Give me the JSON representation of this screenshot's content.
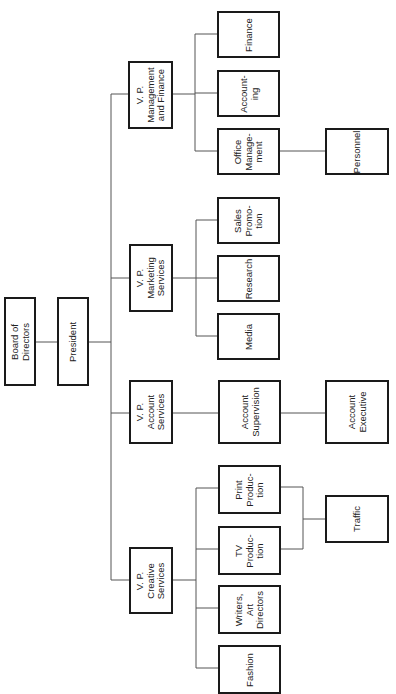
{
  "org_chart": {
    "orientation": "rotated-90-ccw",
    "nodes": {
      "board": {
        "label": "Board of\nDirectors"
      },
      "president": {
        "label": "President"
      },
      "vp_mgmt": {
        "label": "V. P.\nManagement\nand Finance"
      },
      "finance": {
        "label": "Finance"
      },
      "accounting": {
        "label": "Account-\ning"
      },
      "office_mgmt": {
        "label": "Office\nManage-\nment"
      },
      "personnel": {
        "label": "Personnel"
      },
      "vp_marketing": {
        "label": "V. P.\nMarketing\nServices"
      },
      "sales_promo": {
        "label": "Sales\nPromo-\ntion"
      },
      "research": {
        "label": "Research"
      },
      "media": {
        "label": "Media"
      },
      "vp_account": {
        "label": "V. P.\nAccount\nServices"
      },
      "account_supervision": {
        "label": "Account\nSupervision"
      },
      "account_executive": {
        "label": "Account\nExecutive"
      },
      "vp_creative": {
        "label": "V. P.\nCreative\nServices"
      },
      "print_production": {
        "label": "Print\nProduc-\ntion"
      },
      "tv_production": {
        "label": "TV\nProduc-\ntion"
      },
      "writers": {
        "label": "Writers,\nArt\nDirectors"
      },
      "fashion": {
        "label": "Fashion"
      },
      "traffic": {
        "label": "Traffic"
      }
    },
    "hierarchy": {
      "Board of Directors": {
        "President": {
          "V. P. Management and Finance": [
            "Finance",
            "Accounting",
            "Office Management > Personnel"
          ],
          "V. P. Marketing Services": [
            "Sales Promotion",
            "Research",
            "Media"
          ],
          "V. P. Account Services": [
            "Account Supervision > Account Executive"
          ],
          "V. P. Creative Services": [
            "Print Production",
            "TV Production",
            "Writers, Art Directors",
            "Fashion"
          ]
        }
      },
      "shared": {
        "Traffic": [
          "Print Production",
          "TV Production"
        ]
      }
    },
    "colors": {
      "border": "#1a1a1a",
      "line": "#555555",
      "background": "#ffffff",
      "text": "#222222"
    }
  }
}
